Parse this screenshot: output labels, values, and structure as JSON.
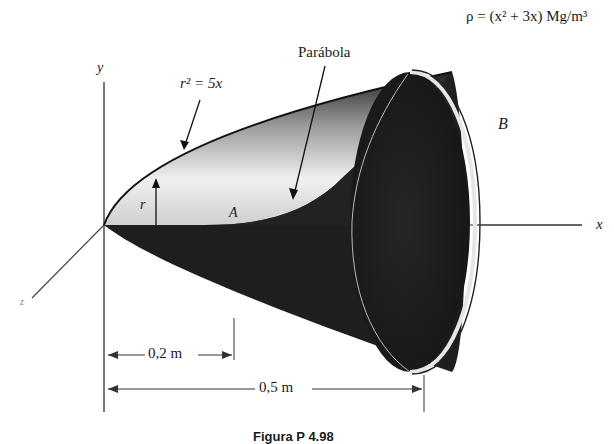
{
  "figure": {
    "density_formula": "ρ = (x² + 3x) Mg/m³",
    "axes": {
      "y": "y",
      "x": "x",
      "z": "z"
    },
    "labels": {
      "outer_curve": "r² = 5x",
      "inner_curve": "Parábola",
      "radius": "r",
      "point_a": "A",
      "point_b": "B"
    },
    "dimensions": {
      "short": "0,2 m",
      "long": "0,5 m"
    },
    "caption": "Figura P 4.98"
  },
  "colors": {
    "shape_dark": "#1e1e1e",
    "shape_light": "#e8e8e8",
    "ink": "#1a1a1a"
  }
}
